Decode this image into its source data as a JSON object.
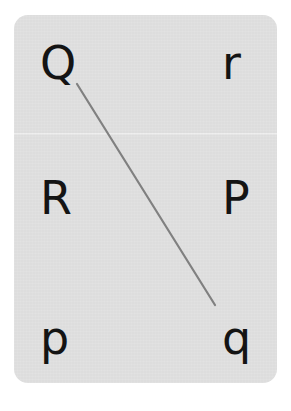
{
  "canvas": {
    "width": 291,
    "height": 411,
    "background_color": "#ffffff"
  },
  "card": {
    "background_color": "#dfdfdf",
    "corner_radius": 14,
    "x": 14,
    "y": 15,
    "width": 263,
    "height": 368,
    "seam_y": 133
  },
  "exercise": {
    "type": "letter-matching",
    "description": "Matching worksheet: draw a line from each letter on the left to its partner on the right",
    "grid": {
      "columns": 2,
      "rows": 3
    },
    "cells": [
      {
        "id": "cell-top-left",
        "letter": "Q",
        "case": "uppercase",
        "column": "left",
        "row": "top"
      },
      {
        "id": "cell-top-right",
        "letter": "r",
        "case": "lowercase",
        "column": "right",
        "row": "top"
      },
      {
        "id": "cell-middle-left",
        "letter": "R",
        "case": "uppercase",
        "column": "left",
        "row": "middle"
      },
      {
        "id": "cell-middle-right",
        "letter": "P",
        "case": "uppercase",
        "column": "right",
        "row": "middle"
      },
      {
        "id": "cell-bottom-left",
        "letter": "p",
        "case": "lowercase",
        "column": "left",
        "row": "bottom"
      },
      {
        "id": "cell-bottom-right",
        "letter": "q",
        "case": "lowercase",
        "column": "right",
        "row": "bottom"
      }
    ],
    "letter_color": "#141414",
    "letter_size_px": 46
  },
  "connector": {
    "label": "Q to q matching line",
    "from_letter": "Q",
    "to_letter": "q",
    "x1": 77,
    "y1": 84,
    "x2": 215,
    "y2": 305,
    "color": "#808080",
    "stroke_width": 2.2
  }
}
